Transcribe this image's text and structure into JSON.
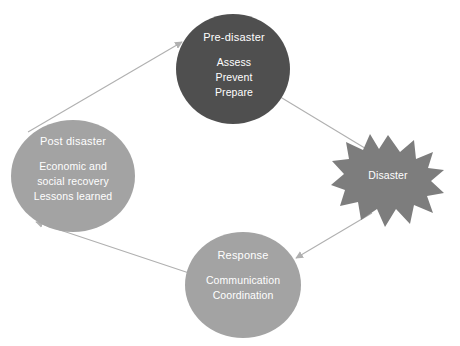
{
  "diagram": {
    "type": "cycle-diagram",
    "background_color": "#ffffff",
    "nodes": [
      {
        "id": "pre-disaster",
        "shape": "circle",
        "title": "Pre-disaster",
        "lines": [
          "Assess",
          "Prevent",
          "Prepare"
        ],
        "fill": "#4f4f4f",
        "text_color": "#ffffff",
        "cx": 233,
        "cy": 69,
        "rx": 57,
        "ry": 55
      },
      {
        "id": "post-disaster",
        "shape": "circle",
        "title": "Post disaster",
        "lines": [
          "Economic and",
          "social recovery",
          "Lessons learned"
        ],
        "fill": "#a3a3a3",
        "text_color": "#ffffff",
        "cx": 73,
        "cy": 176,
        "rx": 62,
        "ry": 56
      },
      {
        "id": "response",
        "shape": "circle",
        "title": "Response",
        "lines": [
          "Communication",
          "Coordination"
        ],
        "fill": "#a3a3a3",
        "text_color": "#ffffff",
        "cx": 243,
        "cy": 285,
        "rx": 58,
        "ry": 53
      },
      {
        "id": "disaster",
        "shape": "explosion-star",
        "title": "Disaster",
        "lines": [],
        "fill": "#7d7d7d",
        "text_color": "#ffffff",
        "cx": 388,
        "cy": 181,
        "rx": 56,
        "ry": 46
      }
    ],
    "connectors": [
      {
        "id": "post-to-pre",
        "from": "post-disaster",
        "to": "pre-disaster",
        "arrowhead": "to",
        "color": "#b0b0b0"
      },
      {
        "id": "pre-to-disaster",
        "from": "pre-disaster",
        "to": "disaster",
        "arrowhead": "to",
        "color": "#b0b0b0"
      },
      {
        "id": "disaster-to-response",
        "from": "disaster",
        "to": "response",
        "arrowhead": "to",
        "color": "#b0b0b0"
      },
      {
        "id": "response-to-post",
        "from": "response",
        "to": "post-disaster",
        "arrowhead": "to",
        "color": "#b0b0b0"
      }
    ]
  }
}
